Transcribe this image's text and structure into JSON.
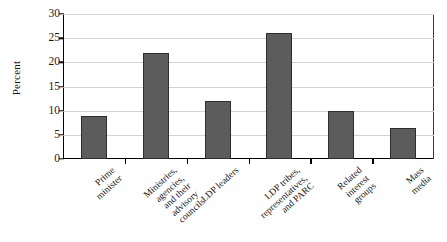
{
  "chart_data": {
    "type": "bar",
    "title": "",
    "subtitle": "",
    "xlabel": "",
    "ylabel": "Percent",
    "ylim": [
      0,
      30
    ],
    "yticks": [
      0,
      5,
      10,
      15,
      20,
      25,
      30
    ],
    "grid": "horizontal",
    "legend": "none",
    "categories": [
      "Prime minister",
      "Ministries, agencies, and their advisory councils",
      "LDP leaders",
      "LDP tribes, representatives, and PARC",
      "Related interest groups",
      "Mass media"
    ],
    "category_lines": [
      [
        "Prime",
        "minister"
      ],
      [
        "Ministries,",
        "agencies,",
        "and their",
        "advisory",
        "councils"
      ],
      [
        "LDP leaders"
      ],
      [
        "LDP  tribes,",
        "representatives,",
        "and PARC"
      ],
      [
        "Related",
        "interest",
        "groups"
      ],
      [
        "Mass",
        "media"
      ]
    ],
    "values": [
      9,
      22,
      12,
      26,
      10,
      6.5
    ],
    "bar_color": "#5c5c5c",
    "bar_edge_color": "#2e2e2e",
    "gridline_color": "#d2d2d2",
    "axis_color": "#000000",
    "background_color": "#ffffff"
  }
}
